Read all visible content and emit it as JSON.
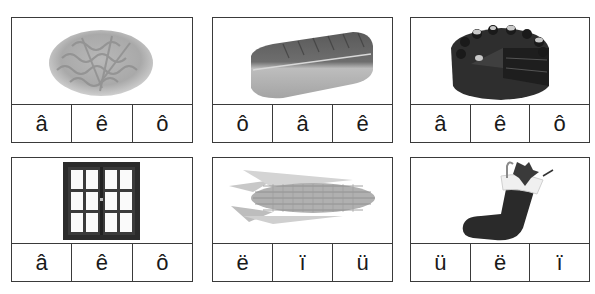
{
  "worksheet": {
    "cards": [
      {
        "picture": "pasta-fusilli",
        "letters": [
          "â",
          "ê",
          "ô"
        ]
      },
      {
        "picture": "roast-meat",
        "letters": [
          "ô",
          "â",
          "ê"
        ]
      },
      {
        "picture": "chocolate-cake",
        "letters": [
          "â",
          "ê",
          "ô"
        ]
      },
      {
        "picture": "window",
        "letters": [
          "â",
          "ê",
          "ô"
        ]
      },
      {
        "picture": "corn-cob",
        "letters": [
          "ë",
          "ï",
          "ü"
        ]
      },
      {
        "picture": "christmas-stocking",
        "letters": [
          "ü",
          "ë",
          "ï"
        ]
      }
    ]
  }
}
